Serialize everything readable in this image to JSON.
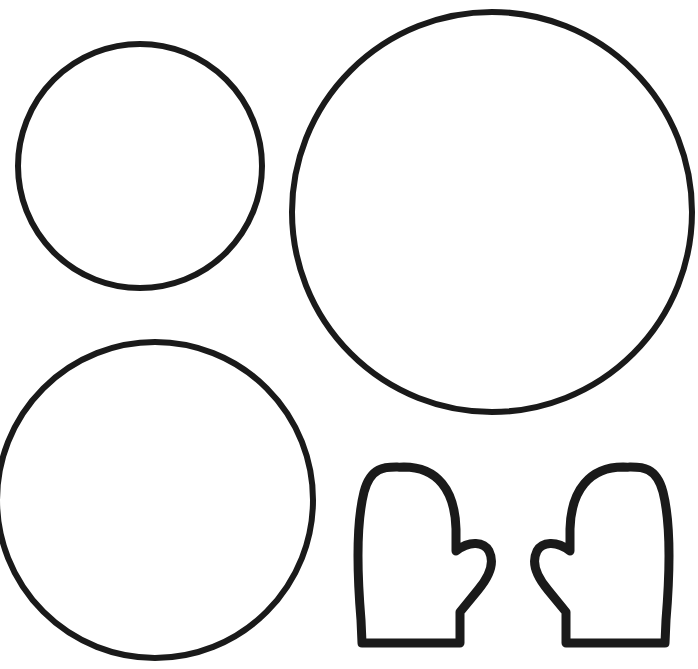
{
  "canvas": {
    "width": 698,
    "height": 669,
    "background_color": "#ffffff",
    "stroke_color": "#1a1a1a",
    "title": "Snowman Craft Template"
  },
  "shapes": [
    {
      "id": "circle-small-top-left",
      "name": "Small Circle (snowman head)",
      "type": "circle",
      "cx": 140,
      "cy": 166,
      "r": 122,
      "stroke_width": 6
    },
    {
      "id": "circle-large-top-right",
      "name": "Large Circle (snowman bottom)",
      "type": "circle",
      "cx": 492,
      "cy": 212,
      "r": 200,
      "stroke_width": 6
    },
    {
      "id": "circle-medium-bottom-left",
      "name": "Medium Circle (snowman middle)",
      "type": "circle",
      "cx": 155,
      "cy": 500,
      "r": 158,
      "stroke_width": 6
    },
    {
      "id": "mitten-left",
      "name": "Left Mitten",
      "type": "mitten",
      "orientation": "left",
      "stroke_width": 9,
      "path": "M 460 643 L 362 643 L 361 620 C 356 560 357 520 364 492 C 372 462 391 468 404 467 C 437 467 455 490 456 529 L 456 551 C 470 540 484 542 489 551 C 495 563 489 577 478 590 L 460 612 Z"
    },
    {
      "id": "mitten-right",
      "name": "Right Mitten",
      "type": "mitten",
      "orientation": "right",
      "stroke_width": 9,
      "path": "M 566 643 L 665 643 L 666 620 C 671 560 670 520 663 492 C 655 462 636 468 623 467 C 590 467 571 490 570 529 L 570 551 C 556 540 542 542 537 551 C 531 563 537 577 548 590 L 566 612 Z"
    }
  ]
}
